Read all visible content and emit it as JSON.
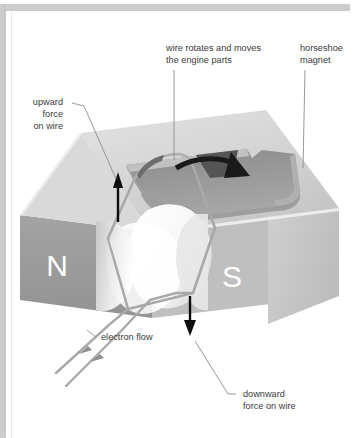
{
  "figure": {
    "background_color": "#ffffff",
    "border_color": "#b5b5b5",
    "width": 354,
    "height": 438
  },
  "labels": {
    "wire_rotates_line1": "wire rotates and moves",
    "wire_rotates_line2": "the engine parts",
    "horseshoe_line1": "horseshoe",
    "horseshoe_line2": "magnet",
    "upward_line1": "upward",
    "upward_line2": "force",
    "upward_line3": "on wire",
    "electron_flow": "electron flow",
    "downward_line1": "downward",
    "downward_line2": "force on wire"
  },
  "poles": {
    "north": "N",
    "south": "S"
  },
  "colors": {
    "magnet_top": "#d2d2d2",
    "magnet_top_light": "#dcdcdc",
    "magnet_front_dark": "#9c9c9c",
    "magnet_side": "#c8c8c8",
    "magnet_cavity": "#8f8f8f",
    "magnet_cavity_dark": "#7d7d7d",
    "wire": "#a8a8a8",
    "wire_light": "#f2f2f2",
    "arrow": "#111111",
    "leader_line": "#8d8d8d",
    "label_text": "#3a3a3a",
    "pole_text": "#ffffff",
    "border": "#b5b5b5"
  },
  "annotations": {
    "rotation_arrow": "curved-rotation-arrow",
    "upward_force_arrow": "up-arrow",
    "downward_force_arrow": "down-arrow",
    "electron_flow_arrows": "two-arrowheads-on-lead-wires"
  }
}
